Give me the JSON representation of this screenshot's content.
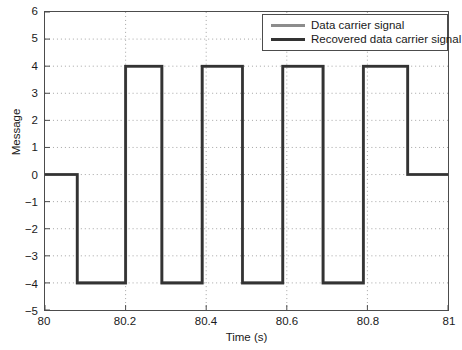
{
  "chart_data": {
    "type": "line",
    "title": "",
    "xlabel": "Time (s)",
    "ylabel": "Message",
    "xlim": [
      80,
      81
    ],
    "ylim": [
      -5,
      6
    ],
    "xticks": [
      80,
      80.2,
      80.4,
      80.6,
      80.8,
      81
    ],
    "xtick_labels": [
      "80",
      "80.2",
      "80.4",
      "80.6",
      "80.8",
      "81"
    ],
    "yticks": [
      -5,
      -4,
      -3,
      -2,
      -1,
      0,
      1,
      2,
      3,
      4,
      5,
      6
    ],
    "ytick_labels": [
      "−5",
      "−4",
      "−3",
      "−2",
      "−1",
      "0",
      "1",
      "2",
      "3",
      "4",
      "5",
      "6"
    ],
    "grid": true,
    "grid_style": "dotted",
    "legend_position": "top-right",
    "series": [
      {
        "name": "Data carrier signal",
        "color": "#8c8c8c",
        "linewidth": 3,
        "step": "post",
        "x": [
          80,
          80.08,
          80.2,
          80.29,
          80.39,
          80.49,
          80.59,
          80.69,
          80.79,
          80.9,
          81
        ],
        "y": [
          0,
          -4,
          4,
          -4,
          4,
          -4,
          4,
          -4,
          4,
          0,
          0
        ]
      },
      {
        "name": "Recovered data carrier signal",
        "color": "#333333",
        "linewidth": 2.6,
        "step": "post",
        "x": [
          80,
          80.08,
          80.2,
          80.29,
          80.39,
          80.49,
          80.59,
          80.69,
          80.79,
          80.9,
          81
        ],
        "y": [
          0,
          -4,
          4,
          -4,
          4,
          -4,
          4,
          -4,
          4,
          0,
          0
        ]
      }
    ]
  },
  "legend": {
    "entries": [
      {
        "label": "Data carrier signal",
        "color": "#8c8c8c",
        "linewidth": 3
      },
      {
        "label": "Recovered data carrier signal",
        "color": "#333333",
        "linewidth": 3
      }
    ]
  },
  "axes": {
    "box_color": "#4c4c4c",
    "grid_color": "#9a9a9a"
  }
}
